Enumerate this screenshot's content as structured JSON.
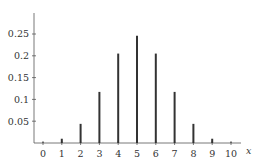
{
  "chart_data": {
    "type": "bar",
    "title": "",
    "xlabel": "x",
    "ylabel": "",
    "categories": [
      "0",
      "1",
      "2",
      "3",
      "4",
      "5",
      "6",
      "7",
      "8",
      "9",
      "10"
    ],
    "values": [
      0.001,
      0.0098,
      0.0439,
      0.1172,
      0.2051,
      0.2461,
      0.2051,
      0.1172,
      0.0439,
      0.0098,
      0.001
    ],
    "yticks": [
      "0.05",
      "0.1",
      "0.15",
      "0.2",
      "0.25"
    ],
    "ytick_values": [
      0.05,
      0.1,
      0.15,
      0.2,
      0.25
    ],
    "ylim": [
      0,
      0.3
    ],
    "grid": false,
    "legend": null
  }
}
